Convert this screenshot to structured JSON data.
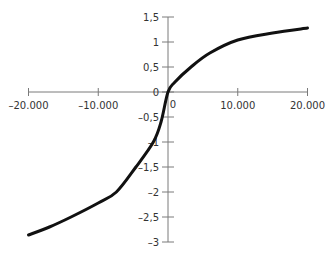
{
  "chart_data": {
    "type": "line",
    "title": "",
    "xlabel": "",
    "ylabel": "",
    "xlim": [
      -20000,
      20000
    ],
    "ylim": [
      -3,
      1.5
    ],
    "grid": false,
    "legend": null,
    "x_ticks": [
      -20000,
      -10000,
      0,
      10000,
      20000
    ],
    "x_tick_labels": [
      "–20.000",
      "–10.000",
      "0",
      "10.000",
      "20.000"
    ],
    "y_ticks": [
      1.5,
      1,
      0.5,
      0,
      -0.5,
      -1,
      -1.5,
      -2,
      -2.5,
      -3
    ],
    "y_tick_labels": [
      "1,5",
      "1",
      "0,5",
      "0",
      "–0,5",
      "–1",
      "–1,5",
      "–2",
      "–2,5",
      "–3"
    ],
    "series": [
      {
        "name": "curve",
        "color": "#111111",
        "x": [
          -20000,
          -17000,
          -13900,
          -10000,
          -7400,
          -4600,
          -2100,
          -1000,
          0,
          1000,
          3300,
          6000,
          10000,
          15000,
          20000
        ],
        "y": [
          -2.86,
          -2.7,
          -2.5,
          -2.22,
          -2.0,
          -1.5,
          -1.0,
          -0.6,
          0.0,
          0.2,
          0.5,
          0.78,
          1.04,
          1.18,
          1.28
        ]
      }
    ]
  },
  "colors": {
    "axis": "#7a7a7a",
    "curve": "#111111",
    "text": "#333333"
  }
}
